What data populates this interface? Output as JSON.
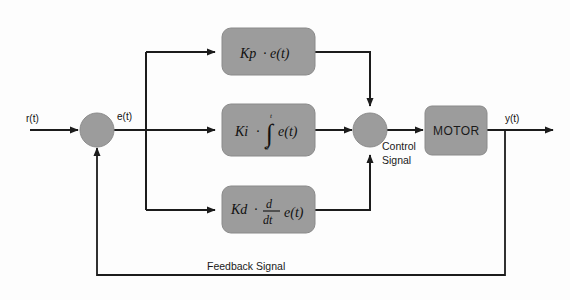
{
  "diagram": {
    "colors": {
      "block_fill": "#9c9c9c",
      "wire": "#1c1c1c",
      "background": "#fdfdfd",
      "text": "#111111"
    },
    "signals": {
      "input": "r(t)",
      "error": "e(t)",
      "output": "y(t)",
      "control": {
        "line1": "Control",
        "line2": "Signal"
      },
      "feedback": "Feedback Signal"
    },
    "blocks": {
      "proportional": {
        "gain": "Kp",
        "dot": "·",
        "term": "e(t)",
        "full_label": "Kp · e(t)"
      },
      "integral": {
        "gain": "Ki",
        "dot": "·",
        "integral_sign": "∫",
        "upper_limit": "t",
        "lower_limit": "0",
        "term": "e(t)",
        "full_label": "Ki · ∫0t e(t)"
      },
      "derivative": {
        "gain": "Kd",
        "dot": "·",
        "numerator": "d",
        "denominator": "dt",
        "term": "e(t)",
        "full_label": "Kd · d/dt e(t)"
      },
      "plant": {
        "label": "MOTOR"
      }
    },
    "nodes": {
      "error_sum": "error-summing-junction",
      "control_sum": "control-summing-junction"
    }
  }
}
